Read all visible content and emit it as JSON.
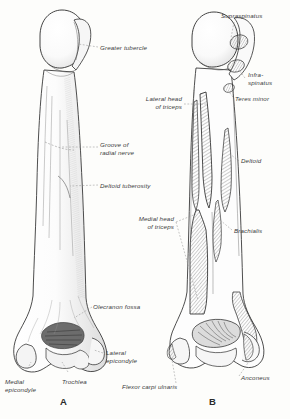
{
  "figure": {
    "type": "anatomical-illustration",
    "background_color": "#fdfdfb",
    "ink_color": "#3b3b3b",
    "panels": [
      {
        "letter": "A",
        "view": "anterior",
        "letter_x": 60,
        "letter_y": 398
      },
      {
        "letter": "B",
        "view": "posterior",
        "letter_x": 209,
        "letter_y": 398
      }
    ],
    "labels": [
      {
        "id": "greater-tubercle",
        "text": "Greater tubercle",
        "x": 100,
        "y": 44,
        "align": "left",
        "leader": [
          [
            98,
            47
          ],
          [
            78,
            44
          ]
        ]
      },
      {
        "id": "groove-radial-nerve",
        "text": "Groove of\nradial nerve",
        "x": 100,
        "y": 144,
        "align": "left",
        "leader": [
          [
            98,
            147
          ],
          [
            62,
            147
          ]
        ]
      },
      {
        "id": "deltoid-tuberosity",
        "text": "Deltoid tuberosity",
        "x": 100,
        "y": 182,
        "align": "left",
        "leader": [
          [
            98,
            185
          ],
          [
            70,
            185
          ]
        ]
      },
      {
        "id": "olecranon-fossa",
        "text": "Olecranon fossa",
        "x": 93,
        "y": 303,
        "align": "left",
        "leader": [
          [
            92,
            307
          ],
          [
            74,
            318
          ]
        ]
      },
      {
        "id": "lateral-epicondyle",
        "text": "Lateral\nepicondyle",
        "x": 105,
        "y": 349,
        "align": "left",
        "leader": [
          [
            103,
            353
          ],
          [
            92,
            349
          ]
        ]
      },
      {
        "id": "medial-epicondyle",
        "text": "Medial\nepicondyle",
        "x": 5,
        "y": 378,
        "align": "left",
        "leader": [
          [
            24,
            377
          ],
          [
            30,
            364
          ]
        ]
      },
      {
        "id": "trochlea",
        "text": "Trochlea",
        "x": 62,
        "y": 378,
        "align": "left",
        "leader": [
          [
            70,
            377
          ],
          [
            64,
            366
          ]
        ]
      },
      {
        "id": "supraspinatus",
        "text": "Supraspinatus",
        "x": 222,
        "y": 14,
        "align": "left",
        "leader": [
          [
            234,
            22
          ],
          [
            226,
            40
          ]
        ]
      },
      {
        "id": "infraspinatus",
        "text": "Infra-\nspinatus",
        "x": 247,
        "y": 73,
        "align": "left",
        "leader": [
          [
            245,
            80
          ],
          [
            232,
            70
          ]
        ]
      },
      {
        "id": "teres-minor",
        "text": "Teres minor",
        "x": 235,
        "y": 96,
        "align": "left",
        "leader": [
          [
            234,
            99
          ],
          [
            226,
            92
          ]
        ]
      },
      {
        "id": "lateral-head-triceps",
        "text": "Lateral head\nof triceps",
        "x": 140,
        "y": 96,
        "align": "left",
        "leader": [
          [
            182,
            104
          ],
          [
            204,
            104
          ]
        ]
      },
      {
        "id": "deltoid",
        "text": "Deltoid",
        "x": 240,
        "y": 158,
        "align": "left",
        "leader": [
          [
            239,
            161
          ],
          [
            230,
            154
          ]
        ]
      },
      {
        "id": "medial-head-triceps",
        "text": "Medial head\nof triceps",
        "x": 128,
        "y": 216,
        "align": "left",
        "leader": [
          [
            176,
            220
          ],
          [
            196,
            214
          ]
        ]
      },
      {
        "id": "brachialis",
        "text": "Brachialis",
        "x": 233,
        "y": 227,
        "align": "left",
        "leader": [
          [
            232,
            230
          ],
          [
            222,
            222
          ]
        ]
      },
      {
        "id": "anconeus",
        "text": "Anconeus",
        "x": 240,
        "y": 379,
        "align": "left",
        "leader": [
          [
            239,
            378
          ],
          [
            230,
            366
          ]
        ]
      },
      {
        "id": "flexor-carpi-ulnaris",
        "text": "Flexor carpi ulnaris",
        "x": 124,
        "y": 386,
        "align": "left",
        "leader": [
          [
            175,
            385
          ],
          [
            186,
            372
          ]
        ]
      }
    ]
  }
}
